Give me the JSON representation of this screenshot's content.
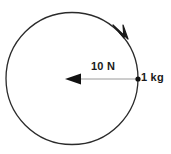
{
  "figure": {
    "title": "",
    "background_color": "#ffffff",
    "stroke_color": "#2b2b2b",
    "line_color": "#9a9a9a",
    "width": 171,
    "height": 154
  },
  "diagram": {
    "type": "circular-motion-free-body",
    "circle": {
      "name": "circular-path",
      "center_x": 72,
      "center_y": 78.5,
      "radius": 66,
      "stroke_color": "#2b2b2b"
    },
    "direction_arrow": {
      "name": "clockwise-direction-arrowhead",
      "position_x": 122,
      "position_y": 33,
      "direction": "clockwise"
    },
    "force_vector": {
      "label": "10 N",
      "direction": "left",
      "from_x": 138,
      "to_x": 66,
      "y": 79,
      "color": "#9a9a9a",
      "arrowhead_color": "#1a1a1a"
    },
    "mass_point": {
      "label": "1 kg",
      "x": 138,
      "y": 79,
      "dot_color": "#1a1a1a"
    }
  },
  "labels": {
    "force": "10 N",
    "mass": "1 kg"
  }
}
